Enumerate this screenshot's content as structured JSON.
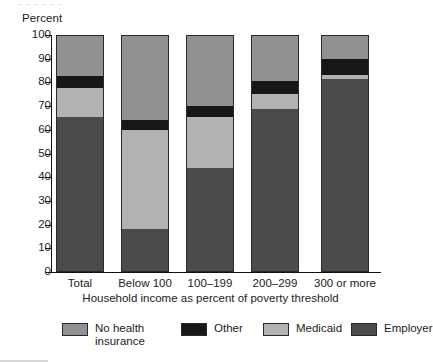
{
  "top_artifact": "• • • • • •",
  "axes": {
    "y_title": "Percent",
    "x_title": "Household income as percent of poverty threshold",
    "y_ticks": [
      "0",
      "10",
      "20",
      "30",
      "40",
      "50",
      "60",
      "70",
      "80",
      "90",
      "100"
    ]
  },
  "legend": {
    "items": [
      {
        "label": "No health insurance",
        "color": "#919191"
      },
      {
        "label": "Other",
        "color": "#171717"
      },
      {
        "label": "Medicaid",
        "color": "#b2b2b2"
      },
      {
        "label": "Employer",
        "color": "#4b4b4b"
      }
    ]
  },
  "chart_data": {
    "type": "bar",
    "stacked": true,
    "title": "",
    "xlabel": "Household income as percent of poverty threshold",
    "ylabel": "Percent",
    "ylim": [
      0,
      100
    ],
    "ytick_step": 10,
    "grid": false,
    "legend_position": "bottom",
    "categories": [
      "Total",
      "Below 100",
      "100–199",
      "200–299",
      "300 or more"
    ],
    "series": [
      {
        "name": "Employer",
        "color": "#4b4b4b",
        "values": [
          66.0,
          18.5,
          44.5,
          69.0,
          82.0
        ]
      },
      {
        "name": "Medicaid",
        "color": "#b2b2b2",
        "values": [
          12.0,
          42.0,
          21.5,
          6.5,
          1.5
        ]
      },
      {
        "name": "Other",
        "color": "#171717",
        "values": [
          5.0,
          4.0,
          4.5,
          5.5,
          7.0
        ]
      },
      {
        "name": "No health insurance",
        "color": "#919191",
        "values": [
          17.0,
          35.5,
          29.5,
          19.0,
          9.5
        ]
      }
    ]
  }
}
